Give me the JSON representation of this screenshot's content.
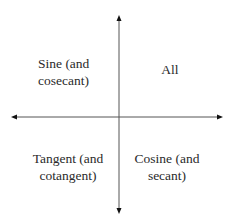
{
  "diagram": {
    "title": "",
    "axes": {
      "color": "#444444"
    },
    "quadrants": [
      {
        "position": "top-left",
        "line1": "Sine (and",
        "line2": "cosecant)"
      },
      {
        "position": "top-right",
        "line1": "All",
        "line2": ""
      },
      {
        "position": "bottom-left",
        "line1": "Tangent (and",
        "line2": "cotangent)"
      },
      {
        "position": "bottom-right",
        "line1": "Cosine (and",
        "line2": "secant)"
      }
    ]
  }
}
